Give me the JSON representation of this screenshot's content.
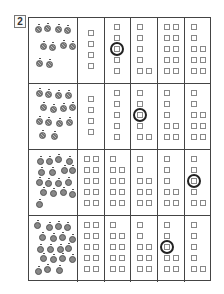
{
  "question_number": "2",
  "rows": [
    {
      "fruit_type": "melon",
      "fruit_count": 10,
      "columns": [
        4,
        5,
        6,
        10,
        8
      ],
      "circled_column": 1,
      "circled_square_index": 2
    },
    {
      "fruit_type": "melon",
      "fruit_count": 14,
      "columns": [
        4,
        5,
        6,
        7,
        8
      ],
      "circled_column": 2,
      "circled_square_index": 2
    },
    {
      "fruit_type": "apple",
      "fruit_count": 17,
      "columns": [
        10,
        9,
        8,
        7,
        6
      ],
      "circled_column": 4,
      "circled_square_index": 2
    },
    {
      "fruit_type": "apple",
      "fruit_count": 19,
      "columns": [
        10,
        9,
        8,
        7,
        6
      ],
      "circled_column": 3,
      "circled_square_index": 2
    }
  ],
  "colors": {
    "grid_line": "#444444",
    "square_outline": "#888888",
    "circle": "#222222"
  }
}
